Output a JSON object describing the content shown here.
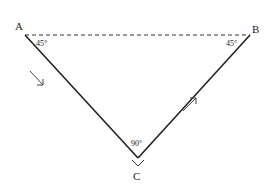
{
  "diagram": {
    "type": "triangle",
    "vertices": [
      {
        "id": "A",
        "label": "A",
        "angle_label": "45°"
      },
      {
        "id": "B",
        "label": "B",
        "angle_label": "45°"
      },
      {
        "id": "C",
        "label": "C",
        "angle_label": "90°"
      }
    ],
    "edges": [
      {
        "from": "A",
        "to": "B",
        "style": "dashed"
      },
      {
        "from": "A",
        "to": "C",
        "style": "solid",
        "arrow": "toward C"
      },
      {
        "from": "C",
        "to": "B",
        "style": "solid",
        "arrow": "toward B"
      }
    ],
    "colors": {
      "line": "#222222",
      "background": "#ffffff"
    }
  }
}
